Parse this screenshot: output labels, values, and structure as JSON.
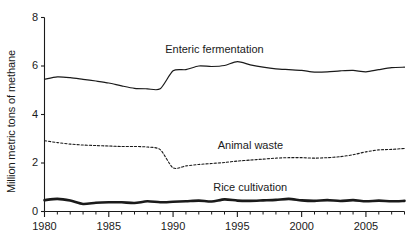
{
  "chart_data": {
    "type": "line",
    "title": "",
    "xlabel": "",
    "ylabel": "Million metric tons of methane",
    "xlim": [
      1980,
      2008
    ],
    "ylim": [
      0,
      8
    ],
    "grid": false,
    "legend_position": "inline-annotations",
    "xticks": [
      1980,
      1985,
      1990,
      1995,
      2000,
      2005
    ],
    "xtick_labels": [
      "1980",
      "1985",
      "1990",
      "1995",
      "2000",
      "2005"
    ],
    "minor_xtick_interval": 1,
    "yticks": [
      0,
      2,
      4,
      6,
      8
    ],
    "ytick_labels": [
      "0",
      "2",
      "4",
      "6",
      "8"
    ],
    "x": [
      1980,
      1981,
      1982,
      1983,
      1984,
      1985,
      1986,
      1987,
      1988,
      1989,
      1990,
      1991,
      1992,
      1993,
      1994,
      1995,
      1996,
      1997,
      1998,
      1999,
      2000,
      2001,
      2002,
      2003,
      2004,
      2005,
      2006,
      2007,
      2008
    ],
    "series": [
      {
        "name": "Enteric fermentation",
        "style": "solid",
        "color": "#1a1a1a",
        "width": 1.2,
        "label_x": 1993.2,
        "label_y": 6.65,
        "values": [
          5.45,
          5.55,
          5.52,
          5.45,
          5.38,
          5.3,
          5.18,
          5.08,
          5.06,
          5.06,
          5.8,
          5.85,
          6.0,
          5.98,
          6.02,
          6.18,
          6.05,
          5.95,
          5.88,
          5.85,
          5.82,
          5.75,
          5.76,
          5.8,
          5.82,
          5.76,
          5.85,
          5.93,
          5.95
        ]
      },
      {
        "name": "Animal waste",
        "style": "dashed",
        "color": "#1a1a1a",
        "width": 1.1,
        "label_x": 1996.0,
        "label_y": 2.72,
        "values": [
          2.92,
          2.84,
          2.78,
          2.74,
          2.72,
          2.7,
          2.68,
          2.68,
          2.66,
          2.55,
          1.8,
          1.88,
          1.94,
          1.98,
          2.02,
          2.08,
          2.12,
          2.16,
          2.2,
          2.22,
          2.22,
          2.2,
          2.22,
          2.26,
          2.34,
          2.46,
          2.54,
          2.56,
          2.6
        ]
      },
      {
        "name": "Rice cultivation",
        "style": "solid",
        "color": "#1a1a1a",
        "width": 2.6,
        "label_x": 1996.0,
        "label_y": 0.95,
        "values": [
          0.47,
          0.52,
          0.45,
          0.31,
          0.36,
          0.38,
          0.38,
          0.35,
          0.42,
          0.38,
          0.4,
          0.42,
          0.45,
          0.41,
          0.5,
          0.45,
          0.44,
          0.46,
          0.48,
          0.52,
          0.46,
          0.44,
          0.47,
          0.43,
          0.47,
          0.42,
          0.45,
          0.42,
          0.44
        ]
      }
    ]
  }
}
